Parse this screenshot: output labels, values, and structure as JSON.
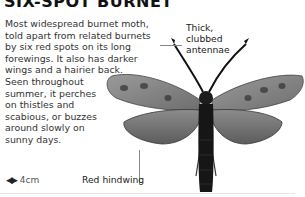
{
  "title": "SIX-SPOT BURNET",
  "description_lines": [
    "Most widespread burnet moth,",
    "told apart from related burnets",
    "by six red spots on its long",
    "forewings. It also has darker",
    "wings and a hairier back.",
    "Seen throughout",
    "summer, it perches",
    "on thistles and",
    "scabious, or buzzes",
    "around slowly on",
    "sunny days."
  ],
  "size": {
    "icon": "wingspan-arrows-icon",
    "value": "4cm"
  },
  "annotations": {
    "antennae": [
      "Thick,",
      "clubbed",
      "antennae"
    ],
    "hindwing": "Red hindwing"
  },
  "colors": {
    "text": "#333333",
    "title": "#111111",
    "moth_dark": "#1a1a1a",
    "wing": "#8a8a8a"
  }
}
